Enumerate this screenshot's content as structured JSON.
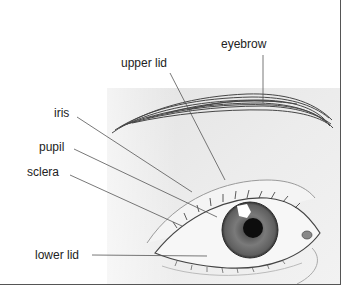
{
  "diagram": {
    "labels": {
      "eyebrow": "eyebrow",
      "upper_lid": "upper lid",
      "iris": "iris",
      "pupil": "pupil",
      "sclera": "sclera",
      "lower_lid": "lower lid"
    },
    "colors": {
      "background": "#ffffff",
      "skin": "#e6e6e6",
      "iris": "#6e6e6e",
      "pupil": "#0d0d0d",
      "sclera": "#f7f7f7",
      "leader": "#555555",
      "frame": "#555555"
    }
  }
}
